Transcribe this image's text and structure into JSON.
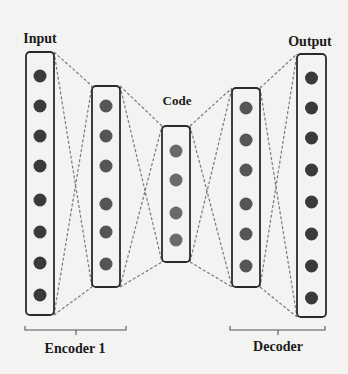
{
  "labels": {
    "input": "Input",
    "code": "Code",
    "output": "Output",
    "encoder": "Encoder 1",
    "decoder": "Decoder"
  },
  "colors": {
    "background": "#f3f3f1",
    "box_stroke": "#2a2a2a",
    "edge_stroke": "#7a7a7a",
    "node_outer": "#3a3a3a",
    "node_hidden": "#555555",
    "node_code": "#6a6a6a"
  },
  "layers": [
    {
      "name": "input",
      "x": 26,
      "y": 52,
      "w": 28,
      "h": 263,
      "nodes": [
        76,
        106,
        136,
        166,
        200,
        232,
        263,
        295
      ],
      "fill": "node_outer"
    },
    {
      "name": "encoder-hidden",
      "x": 92,
      "y": 86,
      "w": 28,
      "h": 201,
      "nodes": [
        106,
        136,
        166,
        204,
        232,
        264
      ],
      "fill": "node_hidden"
    },
    {
      "name": "code",
      "x": 162,
      "y": 126,
      "w": 28,
      "h": 136,
      "nodes": [
        151,
        180,
        213,
        240
      ],
      "fill": "node_code"
    },
    {
      "name": "decoder-hidden",
      "x": 232,
      "y": 88,
      "w": 28,
      "h": 199,
      "nodes": [
        108,
        140,
        170,
        204,
        234,
        266
      ],
      "fill": "node_hidden"
    },
    {
      "name": "output",
      "x": 297,
      "y": 54,
      "w": 29,
      "h": 263,
      "nodes": [
        78,
        108,
        138,
        170,
        202,
        234,
        266,
        298
      ],
      "fill": "node_outer"
    }
  ],
  "brackets": [
    {
      "name": "encoder",
      "x1": 25,
      "x2": 126,
      "y": 330,
      "tick_x": 76
    },
    {
      "name": "decoder",
      "x1": 230,
      "x2": 325,
      "y": 330,
      "tick_x": 278
    }
  ]
}
